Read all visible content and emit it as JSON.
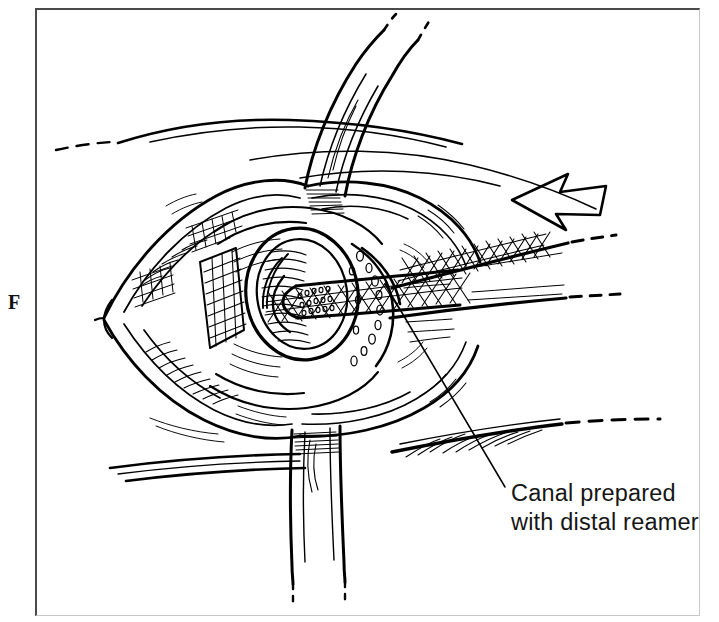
{
  "figure": {
    "panel_letter": "F",
    "domain_type": "medical-surgical-line-illustration",
    "background_color": "#ffffff",
    "ink_color": "#000000",
    "frame": {
      "top_left_border_color": "#4a4a4a",
      "bottom_right_border_color": "#c8c8c8",
      "x": 35,
      "y": 8,
      "width": 665,
      "height": 608
    }
  },
  "callout": {
    "leader_line": {
      "from_x": 385,
      "from_y": 284,
      "to_x": 505,
      "to_y": 487,
      "color": "#161616"
    },
    "lines": [
      "Canal prepared",
      "with distal reamer"
    ],
    "line1": "Canal prepared",
    "line2": "with distal reamer",
    "text_x": 511,
    "line1_baseline_y": 501,
    "line2_baseline_y": 530
  },
  "annotations": {
    "direction_arrow": {
      "name": "direction-arrow",
      "points_toward": "left",
      "style": "hollow-outline",
      "center_x": 557,
      "center_y": 198
    },
    "retractors": [
      {
        "name": "retractor-blade-upper",
        "position": "top-center",
        "description": "curved retractor blade descending from top edge into the wound"
      },
      {
        "name": "retractor-blade-lower",
        "position": "bottom-center",
        "description": "curved retractor blade descending below the wound, ends in dashed break marks"
      }
    ],
    "instrument": {
      "name": "distal-reamer",
      "description": "knurled cross-hatched reamer shaft entering the medullary canal from the right; shaft ends in dashed break marks",
      "surface_texture": "diamond cross-hatch knurl"
    },
    "bone": {
      "name": "cut-bone-end",
      "description": "transected bone end showing cortical rim, cancellous bone and the reamed medullary canal"
    },
    "break_marks": [
      {
        "name": "break-mark-skin-upper-left",
        "x": 62,
        "y": 146
      },
      {
        "name": "break-mark-skin-lower-right",
        "x": 660,
        "y": 422
      },
      {
        "name": "break-mark-reamer-shaft-upper",
        "x": 582,
        "y": 243
      },
      {
        "name": "break-mark-reamer-shaft-lower",
        "x": 578,
        "y": 298
      },
      {
        "name": "break-mark-retractor-upper",
        "x": 384,
        "y": 36
      },
      {
        "name": "break-mark-retractor-lower-a",
        "x": 293,
        "y": 588
      },
      {
        "name": "break-mark-retractor-lower-b",
        "x": 345,
        "y": 586
      }
    ]
  }
}
